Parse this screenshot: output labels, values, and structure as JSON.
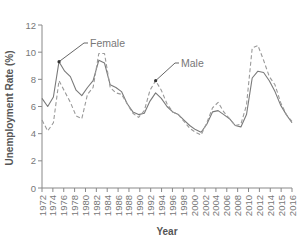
{
  "chart_data": {
    "type": "line",
    "title": "",
    "xlabel": "Year",
    "ylabel": "Unemployment Rate (%)",
    "ylim": [
      0,
      12
    ],
    "yticks": [
      0,
      2,
      4,
      6,
      8,
      10,
      12
    ],
    "xlim": [
      1972,
      2016
    ],
    "xtick_labels": [
      "1972",
      "1974",
      "1976",
      "1978",
      "1980",
      "1982",
      "1984",
      "1986",
      "1988",
      "1990",
      "1992",
      "1994",
      "1996",
      "1998",
      "2000",
      "2002",
      "2004",
      "2006",
      "2008",
      "2010",
      "2012",
      "2014",
      "2015",
      "2016"
    ],
    "grid": false,
    "legend_position": "inline annotations",
    "x": [
      1972,
      1973,
      1974,
      1975,
      1976,
      1977,
      1978,
      1979,
      1980,
      1981,
      1982,
      1983,
      1984,
      1985,
      1986,
      1987,
      1988,
      1989,
      1990,
      1991,
      1992,
      1993,
      1994,
      1995,
      1996,
      1997,
      1998,
      1999,
      2000,
      2001,
      2002,
      2003,
      2004,
      2005,
      2006,
      2007,
      2008,
      2009,
      2010,
      2011,
      2012,
      2013,
      2014,
      2015,
      2016
    ],
    "series": [
      {
        "name": "Female",
        "style": "solid",
        "color": "#7a7a7a",
        "values": [
          6.6,
          6.0,
          6.7,
          9.3,
          8.6,
          8.2,
          7.2,
          6.8,
          7.4,
          7.9,
          9.4,
          9.2,
          7.6,
          7.4,
          7.1,
          6.2,
          5.6,
          5.4,
          5.5,
          6.4,
          7.0,
          6.6,
          6.0,
          5.6,
          5.4,
          5.0,
          4.6,
          4.3,
          4.1,
          4.7,
          5.6,
          5.7,
          5.4,
          5.1,
          4.6,
          4.5,
          5.4,
          8.1,
          8.6,
          8.5,
          7.9,
          7.1,
          6.1,
          5.4,
          4.8
        ]
      },
      {
        "name": "Male",
        "style": "dashed",
        "color": "#9a9a9a",
        "values": [
          5.0,
          4.2,
          4.8,
          7.9,
          7.1,
          6.3,
          5.3,
          5.1,
          6.9,
          7.4,
          9.9,
          9.9,
          7.4,
          7.0,
          6.9,
          6.2,
          5.5,
          5.2,
          5.7,
          7.2,
          7.9,
          7.2,
          6.2,
          5.6,
          5.4,
          4.9,
          4.4,
          4.1,
          3.9,
          4.8,
          5.9,
          6.3,
          5.6,
          5.1,
          4.6,
          4.7,
          6.1,
          10.3,
          10.5,
          9.4,
          8.2,
          7.6,
          6.3,
          5.4,
          4.9
        ]
      }
    ],
    "annotations": [
      {
        "text": "Female",
        "points_to_year": 1975,
        "points_to_value": 9.3
      },
      {
        "text": "Male",
        "points_to_year": 1992,
        "points_to_value": 7.9
      }
    ]
  }
}
